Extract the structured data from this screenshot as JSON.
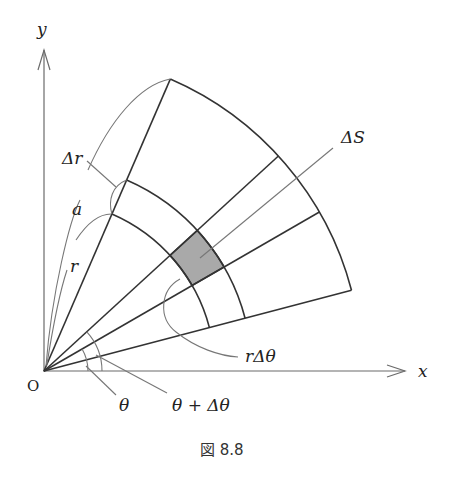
{
  "figure": {
    "caption": "図 8.8",
    "labels": {
      "y_axis": "y",
      "x_axis": "x",
      "origin": "O",
      "delta_r": "Δr",
      "a": "a",
      "r": "r",
      "delta_S": "ΔS",
      "r_delta_theta": "rΔθ",
      "theta": "θ",
      "theta_plus_delta_theta": "θ + Δθ"
    },
    "colors": {
      "lines": "#333333",
      "axes": "#6b6b6b",
      "shaded_area": "#a9a9a9",
      "background": "#ffffff"
    }
  }
}
